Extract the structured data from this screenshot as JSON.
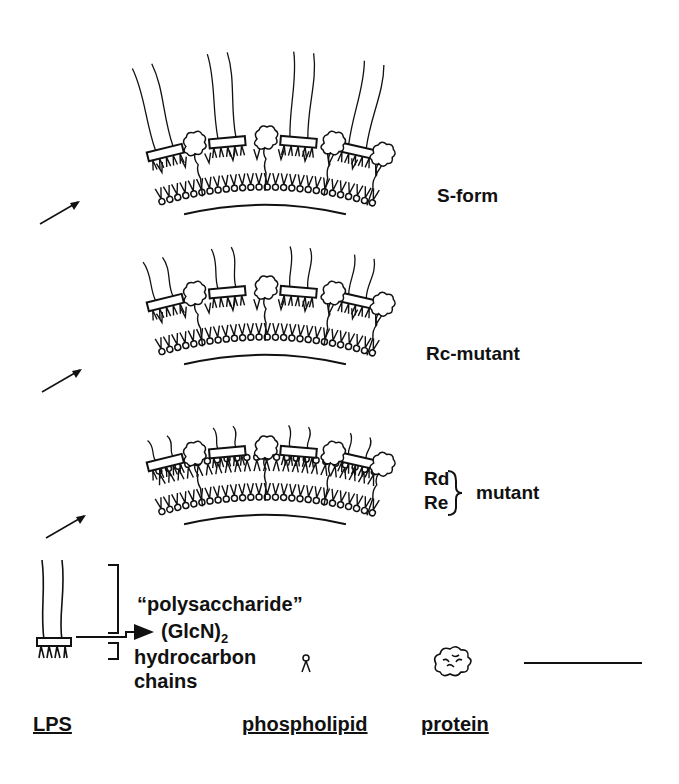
{
  "panels": [
    {
      "id": "s-form",
      "label": "S-form",
      "chain_length": "long"
    },
    {
      "id": "rc-mutant",
      "label": "Rc-mutant",
      "chain_length": "medium"
    },
    {
      "id": "rd-re-mutant",
      "label_top": "Rd",
      "label_bottom": "Re",
      "label_right": "mutant",
      "chain_length": "short"
    }
  ],
  "legend": {
    "polysaccharide": "“polysaccharide”",
    "glcn": "(GlcN)",
    "glcn_sub": "2",
    "hydrocarbon_line1": "hydrocarbon",
    "hydrocarbon_line2": "chains",
    "lps": "LPS",
    "phospholipid": "phospholipid",
    "protein": "protein"
  },
  "colors": {
    "ink": "#111111",
    "background": "#ffffff"
  }
}
